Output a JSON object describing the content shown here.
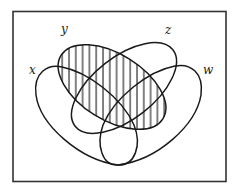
{
  "diagram": {
    "type": "venn",
    "sets": [
      {
        "id": "x",
        "label": "x",
        "shaded": false
      },
      {
        "id": "y",
        "label": "y",
        "shaded": true,
        "pattern": "vertical-hatch"
      },
      {
        "id": "z",
        "label": "z",
        "shaded": false
      },
      {
        "id": "w",
        "label": "w",
        "shaded": false
      }
    ],
    "shaded_region": "y",
    "colors": {
      "stroke": "#1a1a1a",
      "frame": "#333333",
      "background": "#ffffff"
    }
  }
}
